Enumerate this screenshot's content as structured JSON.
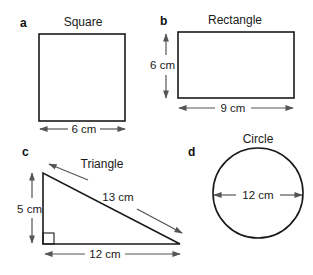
{
  "figures": {
    "a": {
      "letter": "a",
      "title": "Square",
      "side_label": "6 cm"
    },
    "b": {
      "letter": "b",
      "title": "Rectangle",
      "height_label": "6 cm",
      "width_label": "9 cm"
    },
    "c": {
      "letter": "c",
      "title": "Triangle",
      "height_label": "5 cm",
      "base_label": "12 cm",
      "hypotenuse_label": "13 cm"
    },
    "d": {
      "letter": "d",
      "title": "Circle",
      "diameter_label": "12 cm"
    }
  },
  "colors": {
    "stroke": "#1a1a1a",
    "arrow": "#555555",
    "background": "#ffffff"
  }
}
